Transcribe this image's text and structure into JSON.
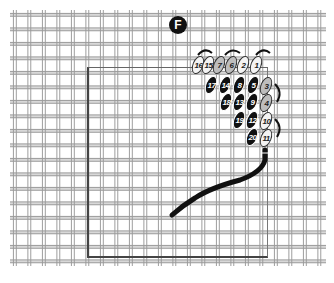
{
  "diagram": {
    "label": "F",
    "colors": {
      "canvas_line": "#9a9a9a",
      "stitch_dark": "#111111",
      "stitch_light": "#f3f3f3",
      "stitch_gray": "#bdbdbd",
      "thread": "#111111"
    },
    "stitches": [
      {
        "n": "16",
        "x": 198,
        "y": 65,
        "tone": "light"
      },
      {
        "n": "15",
        "x": 208,
        "y": 65,
        "tone": "light"
      },
      {
        "n": "7",
        "x": 219,
        "y": 65,
        "tone": "gray"
      },
      {
        "n": "6",
        "x": 231,
        "y": 65,
        "tone": "gray"
      },
      {
        "n": "2",
        "x": 243,
        "y": 65,
        "tone": "light"
      },
      {
        "n": "1",
        "x": 256,
        "y": 65,
        "tone": "light"
      },
      {
        "n": "17",
        "x": 211,
        "y": 85,
        "tone": "dark"
      },
      {
        "n": "14",
        "x": 225,
        "y": 85,
        "tone": "dark"
      },
      {
        "n": "8",
        "x": 239,
        "y": 85,
        "tone": "dark"
      },
      {
        "n": "5",
        "x": 253,
        "y": 85,
        "tone": "dark"
      },
      {
        "n": "3",
        "x": 266,
        "y": 86,
        "tone": "gray"
      },
      {
        "n": "18",
        "x": 226,
        "y": 102,
        "tone": "dark"
      },
      {
        "n": "13",
        "x": 239,
        "y": 102,
        "tone": "dark"
      },
      {
        "n": "9",
        "x": 252,
        "y": 102,
        "tone": "dark"
      },
      {
        "n": "4",
        "x": 266,
        "y": 103,
        "tone": "gray"
      },
      {
        "n": "19",
        "x": 239,
        "y": 120,
        "tone": "dark"
      },
      {
        "n": "12",
        "x": 252,
        "y": 120,
        "tone": "dark"
      },
      {
        "n": "10",
        "x": 266,
        "y": 121,
        "tone": "light"
      },
      {
        "n": "20",
        "x": 252,
        "y": 137,
        "tone": "dark"
      },
      {
        "n": "11",
        "x": 266,
        "y": 138,
        "tone": "light"
      }
    ]
  }
}
